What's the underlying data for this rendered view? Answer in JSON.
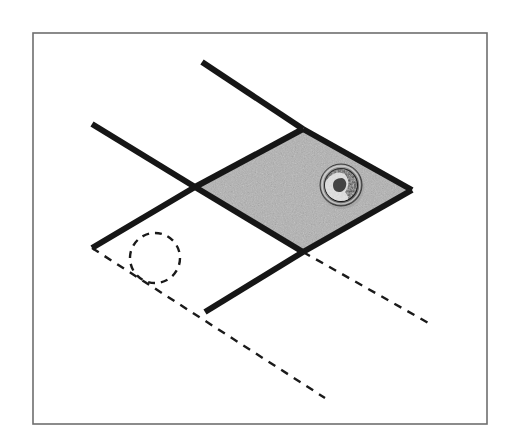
{
  "figure": {
    "caption": "",
    "title": "",
    "type": "line-diagram",
    "background_color": "#ffffff",
    "canvas": {
      "width": 518,
      "height": 446
    }
  },
  "frame": {
    "name": "outer-border",
    "x": 33,
    "y": 33,
    "width": 454,
    "height": 391,
    "stroke_color": "#6e6e6e",
    "stroke_width": 1.6,
    "fill": "none"
  },
  "shaded_region": {
    "name": "shaded-parallelogram",
    "label": "",
    "points": "195,187 303,129 412,190 303,252",
    "fill_color": "#b2b2b2",
    "texture": "speckled-gray-noise",
    "stroke": "none"
  },
  "solid_lines": [
    {
      "name": "upper-right-line",
      "x1": 202,
      "y1": 62,
      "x2": 303,
      "y2": 129,
      "color": "#161616",
      "width": 6
    },
    {
      "name": "upper-left-line",
      "x1": 92,
      "y1": 124,
      "x2": 195,
      "y2": 187,
      "color": "#161616",
      "width": 6
    },
    {
      "name": "parallelogram-edge-top-left",
      "x1": 195,
      "y1": 187,
      "x2": 303,
      "y2": 129,
      "color": "#161616",
      "width": 6
    },
    {
      "name": "parallelogram-edge-top-right",
      "x1": 303,
      "y1": 129,
      "x2": 412,
      "y2": 190,
      "color": "#161616",
      "width": 6
    },
    {
      "name": "parallelogram-edge-bottom-left",
      "x1": 195,
      "y1": 187,
      "x2": 303,
      "y2": 252,
      "color": "#161616",
      "width": 6
    },
    {
      "name": "parallelogram-edge-bottom-right",
      "x1": 303,
      "y1": 252,
      "x2": 412,
      "y2": 190,
      "color": "#161616",
      "width": 6
    },
    {
      "name": "lower-left-line",
      "x1": 195,
      "y1": 187,
      "x2": 92,
      "y2": 248,
      "color": "#161616",
      "width": 6
    },
    {
      "name": "lower-middle-line",
      "x1": 303,
      "y1": 252,
      "x2": 205,
      "y2": 312,
      "color": "#161616",
      "width": 6
    }
  ],
  "dashed_lines": [
    {
      "name": "dashed-line-long-lower",
      "x1": 92,
      "y1": 248,
      "x2": 325,
      "y2": 398,
      "color": "#1a1a1a",
      "width": 2.4,
      "dash": "8 7"
    },
    {
      "name": "dashed-line-right",
      "x1": 303,
      "y1": 252,
      "x2": 432,
      "y2": 325,
      "color": "#1a1a1a",
      "width": 2.4,
      "dash": "8 7"
    }
  ],
  "dashed_circle": {
    "name": "dashed-circle",
    "cx": 155,
    "cy": 258,
    "r": 25,
    "color": "#1a1a1a",
    "width": 2.4,
    "dash": "7 6",
    "fill": "none"
  },
  "coin": {
    "name": "coin-scale-reference",
    "description": "dime",
    "cx": 341,
    "cy": 185,
    "r": 21,
    "rim_color": "#8a8a8a",
    "face_color": "#2a2a2a",
    "highlight_color": "#e2e2e2"
  }
}
